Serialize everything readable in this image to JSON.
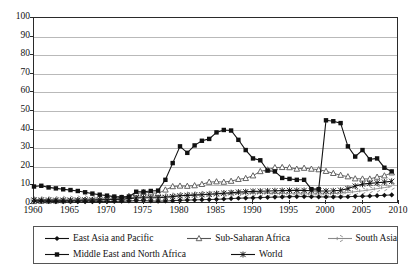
{
  "chart_data": {
    "type": "line",
    "title": "",
    "xlabel": "",
    "ylabel": "",
    "xlim": [
      1960,
      2010
    ],
    "ylim": [
      0,
      100
    ],
    "ytick_step": 10,
    "xtick_step": 5,
    "grid": true,
    "legend_position": "bottom",
    "yticks": [
      "0",
      "10",
      "20",
      "30",
      "40",
      "50",
      "60",
      "70",
      "80",
      "90",
      "100"
    ],
    "xticks": [
      "1960",
      "1965",
      "1970",
      "1975",
      "1980",
      "1985",
      "1990",
      "1995",
      "2000",
      "2005",
      "2010"
    ],
    "x": [
      1960,
      1961,
      1962,
      1963,
      1964,
      1965,
      1966,
      1967,
      1968,
      1969,
      1970,
      1971,
      1972,
      1973,
      1974,
      1975,
      1976,
      1977,
      1978,
      1979,
      1980,
      1981,
      1982,
      1983,
      1984,
      1985,
      1986,
      1987,
      1988,
      1989,
      1990,
      1991,
      1992,
      1993,
      1994,
      1995,
      1996,
      1997,
      1998,
      1999,
      2000,
      2001,
      2002,
      2003,
      2004,
      2005,
      2006,
      2007,
      2008,
      2009
    ],
    "series": [
      {
        "name": "East Asia and Pacific",
        "marker": "diamond",
        "color": "#111111",
        "values": [
          1.6,
          1.5,
          1.4,
          1.3,
          1.3,
          1.2,
          1.2,
          1.2,
          1.2,
          1.3,
          1.3,
          1.4,
          1.5,
          1.6,
          1.8,
          1.8,
          1.6,
          1.5,
          1.6,
          1.8,
          2.0,
          2.1,
          2.2,
          2.3,
          2.4,
          2.5,
          2.7,
          2.9,
          3.1,
          3.2,
          3.3,
          3.5,
          3.6,
          3.7,
          3.8,
          3.9,
          4.0,
          4.0,
          3.9,
          3.8,
          3.8,
          3.8,
          3.8,
          3.9,
          4.1,
          4.2,
          4.3,
          4.5,
          4.7,
          4.9
        ]
      },
      {
        "name": "Middle East and North Africa",
        "marker": "square",
        "color": "#111111",
        "values": [
          9.4,
          9.8,
          8.9,
          8.4,
          7.9,
          7.5,
          7.0,
          6.3,
          5.6,
          5.0,
          4.5,
          4.0,
          3.7,
          4.0,
          6.6,
          6.6,
          7.0,
          7.2,
          13.0,
          22.0,
          31.0,
          27.5,
          31.5,
          34.0,
          35.0,
          38.5,
          39.8,
          39.5,
          34.5,
          29.0,
          24.5,
          23.5,
          18.0,
          17.5,
          14.0,
          13.5,
          13.0,
          13.0,
          8.0,
          8.0,
          45.0,
          44.5,
          43.5,
          31.0,
          25.5,
          29.0,
          24.0,
          24.5,
          19.5,
          17.5
        ]
      },
      {
        "name": "Sub-Saharan Africa",
        "marker": "triangle",
        "color": "#555555",
        "values": [
          1.4,
          1.5,
          1.6,
          1.7,
          1.8,
          1.9,
          2.0,
          2.1,
          2.2,
          2.3,
          2.4,
          2.6,
          3.2,
          4.2,
          5.6,
          6.3,
          6.1,
          5.7,
          7.6,
          9.4,
          9.7,
          9.6,
          9.9,
          10.6,
          11.8,
          12.0,
          11.8,
          12.3,
          13.3,
          13.8,
          15.2,
          17.5,
          18.4,
          19.6,
          19.7,
          19.6,
          18.8,
          19.3,
          18.8,
          18.5,
          17.6,
          16.5,
          15.5,
          14.7,
          13.6,
          13.5,
          13.5,
          14.5,
          15.2,
          16.8
        ]
      },
      {
        "name": "South Asia",
        "marker": "star",
        "color": "#8a8a8a",
        "values": [
          2.2,
          2.3,
          2.3,
          2.4,
          2.5,
          2.6,
          2.7,
          2.8,
          2.8,
          2.9,
          3.0,
          3.1,
          3.2,
          3.4,
          3.7,
          4.0,
          4.0,
          3.9,
          4.0,
          4.3,
          4.6,
          4.8,
          5.0,
          5.2,
          5.3,
          5.4,
          5.5,
          5.6,
          5.7,
          5.8,
          5.9,
          5.9,
          5.8,
          5.7,
          5.6,
          5.6,
          5.5,
          5.5,
          5.4,
          5.4,
          5.5,
          5.6,
          5.8,
          6.2,
          6.6,
          7.1,
          7.6,
          8.2,
          8.8,
          9.4
        ]
      },
      {
        "name": "World",
        "marker": "cross",
        "color": "#111111",
        "values": [
          2.1,
          2.1,
          2.1,
          2.0,
          2.0,
          2.0,
          2.0,
          2.1,
          2.1,
          2.2,
          2.3,
          2.4,
          2.6,
          2.9,
          3.3,
          3.4,
          3.4,
          3.4,
          3.6,
          4.0,
          4.4,
          4.6,
          4.8,
          5.0,
          5.2,
          5.5,
          5.8,
          6.1,
          6.4,
          6.6,
          6.8,
          6.9,
          7.0,
          7.1,
          7.2,
          7.3,
          7.3,
          7.3,
          7.1,
          7.0,
          7.0,
          7.1,
          7.4,
          8.3,
          9.6,
          10.7,
          11.1,
          11.4,
          11.8,
          12.2
        ]
      }
    ],
    "legend": [
      {
        "label": "East Asia and Pacific",
        "marker": "diamond",
        "color": "#111111"
      },
      {
        "label": "Sub-Saharan Africa",
        "marker": "triangle",
        "color": "#555555"
      },
      {
        "label": "South Asia",
        "marker": "star",
        "color": "#8a8a8a"
      },
      {
        "label": "Middle East and North Africa",
        "marker": "square",
        "color": "#111111"
      },
      {
        "label": "World",
        "marker": "cross",
        "color": "#111111"
      }
    ]
  }
}
